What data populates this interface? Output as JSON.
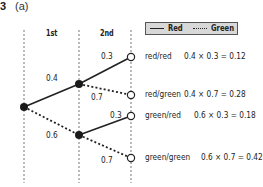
{
  "question": {
    "number": "3",
    "part": "(a)"
  },
  "columns": {
    "first": "1st",
    "second": "2nd"
  },
  "legend": {
    "solid_label": "Red",
    "dashed_label": "Green",
    "background": "#d8d8d8"
  },
  "branches": {
    "first": {
      "red": "0.4",
      "green": "0.6"
    },
    "second_after_red": {
      "red": "0.3",
      "green": "0.7"
    },
    "second_after_green": {
      "red": "0.3",
      "green": "0.7"
    }
  },
  "outcomes": [
    {
      "label": "red/red",
      "calc": "0.4 × 0.3 = 0.12"
    },
    {
      "label": "red/green",
      "calc": "0.4 × 0.7 = 0.28"
    },
    {
      "label": "green/red",
      "calc": "0.6 × 0.3 = 0.18"
    },
    {
      "label": "green/green",
      "calc": "0.6 × 0.7 = 0.42"
    }
  ],
  "colors": {
    "line": "#222222",
    "node_fill": "#1a1a1a",
    "end_node_fill": "#ffffff",
    "guide": "#888888"
  }
}
